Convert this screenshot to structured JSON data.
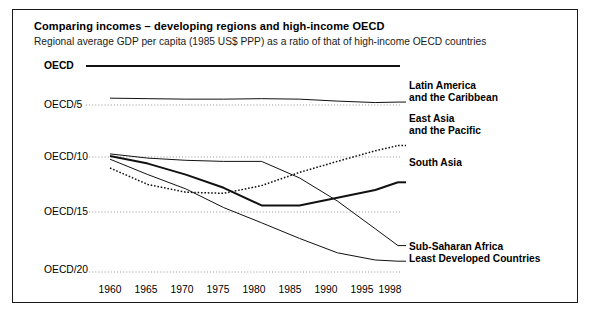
{
  "figure": {
    "title": "Comparing incomes – developing regions and high-income OECD",
    "subtitle": "Regional average GDP per capita (1985 US$ PPP) as a ratio of that of high-income OECD countries"
  },
  "axis": {
    "y_ticks": [
      "OECD",
      "OECD/5",
      "OECD/10",
      "OECD/15",
      "OECD/20"
    ],
    "x_ticks": [
      "1960",
      "1965",
      "1970",
      "1975",
      "1980",
      "1985",
      "1990",
      "1995",
      "1998"
    ]
  },
  "series_labels": {
    "latin_america_l1": "Latin America",
    "latin_america_l2": "and the Caribbean",
    "east_asia_l1": "East Asia",
    "east_asia_l2": "and the Pacific",
    "south_asia": "South Asia",
    "ssa": "Sub-Saharan Africa",
    "ldc": "Least Developed Countries"
  },
  "colors": {
    "ink": "#111111",
    "grid": "#8a8a8a",
    "frame": "#1a1a1a"
  },
  "chart_data": {
    "type": "line",
    "title": "Comparing incomes – developing regions and high-income OECD",
    "subtitle": "Regional average GDP per capita (1985 US$ PPP) as a ratio of that of high-income OECD countries",
    "xlabel": "",
    "ylabel": "Ratio of high-income OECD GDP per capita",
    "x": [
      1960,
      1965,
      1970,
      1975,
      1980,
      1985,
      1990,
      1995,
      1998
    ],
    "y_tick_values": [
      1,
      5,
      10,
      15,
      20
    ],
    "y_tick_labels": [
      "OECD",
      "OECD/5",
      "OECD/10",
      "OECD/15",
      "OECD/20"
    ],
    "y_axis_note": "Values expressed as OECD divided by N; larger N = lower relative income",
    "ylim_divisor": [
      1,
      21.5
    ],
    "grid": "horizontal-dotted",
    "legend_position": "right-inline-labels",
    "series": [
      {
        "name": "OECD",
        "style": "solid-thick-reference",
        "divisor_values": [
          1,
          1,
          1,
          1,
          1,
          1,
          1,
          1,
          1
        ]
      },
      {
        "name": "Latin America and the Caribbean",
        "style": "solid",
        "divisor_values": [
          4.3,
          4.35,
          4.4,
          4.4,
          4.35,
          4.4,
          4.6,
          4.75,
          4.7
        ]
      },
      {
        "name": "East Asia and the Pacific",
        "style": "dotted",
        "divisor_values": [
          11.0,
          12.5,
          13.2,
          13.3,
          12.6,
          11.4,
          10.4,
          9.4,
          8.9
        ]
      },
      {
        "name": "South Asia",
        "style": "solid-thick",
        "divisor_values": [
          9.9,
          10.6,
          11.6,
          12.8,
          14.4,
          14.4,
          13.7,
          13.0,
          12.3
        ]
      },
      {
        "name": "Sub-Saharan Africa",
        "style": "solid",
        "divisor_values": [
          9.7,
          10.1,
          10.3,
          10.4,
          10.4,
          11.9,
          14.0,
          16.4,
          17.8
        ]
      },
      {
        "name": "Least Developed Countries",
        "style": "solid",
        "divisor_values": [
          10.2,
          11.6,
          12.9,
          14.6,
          15.9,
          17.2,
          18.4,
          19.0,
          19.1
        ]
      }
    ]
  }
}
